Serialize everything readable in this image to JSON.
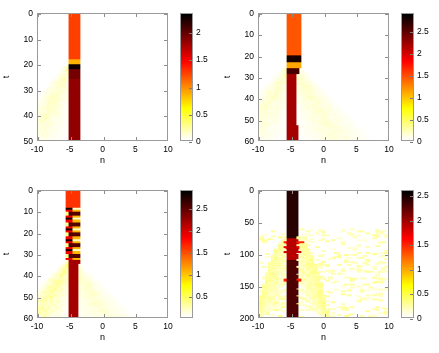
{
  "figure": {
    "kind": "four-panel-heatmap-figure",
    "colormap": "hot",
    "background": "#ffffff",
    "axis_color": "#9a9a9a"
  },
  "chart_data": [
    {
      "id": "panel-top-left",
      "type": "heatmap",
      "title": "",
      "xlabel": "n",
      "ylabel": "t",
      "xlim": [
        -10,
        10
      ],
      "ylim": [
        0,
        50
      ],
      "y_inverted": true,
      "xticks": [
        -10,
        -5,
        0,
        5,
        10
      ],
      "xticklabels": [
        "-10",
        "-5",
        "0",
        "5",
        "10"
      ],
      "yticks": [
        0,
        10,
        20,
        30,
        40,
        50
      ],
      "yticklabels": [
        "0",
        "10",
        "20",
        "30",
        "40",
        "50"
      ],
      "colormap": "hot",
      "clim": [
        0,
        2.35
      ],
      "colorbar": {
        "ticks": [
          0,
          0.5,
          1,
          1.5,
          2
        ],
        "ticklabels": [
          "0",
          "0.5",
          "1",
          "1.5",
          "2"
        ]
      },
      "features": {
        "central_column": {
          "n_range": [
            0,
            1.5
          ],
          "description": "persistent bright vertical stripe at the origin site"
        },
        "segments": [
          {
            "t_range": [
              0,
              18
            ],
            "n_range": [
              0,
              1.5
            ],
            "value": 1.25,
            "color": "#f44c00"
          },
          {
            "t_range": [
              18,
              20
            ],
            "n_range": [
              0,
              1.5
            ],
            "value": 0.85,
            "color": "#ffbf55"
          },
          {
            "t_range": [
              20,
              22
            ],
            "n_range": [
              0,
              1.5
            ],
            "value": 2.3,
            "color": "#2a1005"
          },
          {
            "t_range": [
              22,
              26
            ],
            "n_range": [
              0,
              1.5
            ],
            "value": 1.95,
            "color": "#5e2408"
          },
          {
            "t_range": [
              26,
              50
            ],
            "n_range": [
              0,
              1.5
            ],
            "value": 1.85,
            "color": "#6b2c0c"
          }
        ],
        "radiation": [
          {
            "direction": "down-left",
            "origin_t": 20,
            "value": 0.18,
            "description": "faint yellow fan emitted leftwards after the collapse"
          }
        ]
      }
    },
    {
      "id": "panel-top-right",
      "type": "heatmap",
      "title": "",
      "xlabel": "n",
      "ylabel": "t",
      "xlim": [
        -10,
        10
      ],
      "ylim": [
        0,
        60
      ],
      "y_inverted": true,
      "xticks": [
        -10,
        -5,
        0,
        5,
        10
      ],
      "xticklabels": [
        "-10",
        "-5",
        "0",
        "5",
        "10"
      ],
      "yticks": [
        0,
        10,
        20,
        30,
        40,
        50,
        60
      ],
      "yticklabels": [
        "0",
        "10",
        "20",
        "30",
        "40",
        "50",
        "60"
      ],
      "colormap": "hot",
      "clim": [
        0,
        2.9
      ],
      "colorbar": {
        "ticks": [
          0,
          0.5,
          1,
          1.5,
          2,
          2.5
        ],
        "ticklabels": [
          "0",
          "0.5",
          "1",
          "1.5",
          "2",
          "2.5"
        ]
      },
      "features": {
        "central_column": {
          "n_range": [
            -1.2,
            1.6
          ],
          "description": "twin orange columns flanking a pale core, merging into a dark stripe"
        },
        "segments": [
          {
            "t_range": [
              0,
              20
            ],
            "n_range": [
              -1.2,
              -0.3
            ],
            "value": 1.45,
            "color": "#f4621a"
          },
          {
            "t_range": [
              0,
              20
            ],
            "n_range": [
              -0.3,
              0.6
            ],
            "value": 0.95,
            "color": "#ffc97a"
          },
          {
            "t_range": [
              0,
              20
            ],
            "n_range": [
              0.6,
              1.6
            ],
            "value": 1.45,
            "color": "#f4621a"
          },
          {
            "t_range": [
              20,
              23
            ],
            "n_range": [
              -1.2,
              1.6
            ],
            "value": 2.8,
            "color": "#1e0c04"
          },
          {
            "t_range": [
              23,
              26
            ],
            "n_range": [
              -1.2,
              1.6
            ],
            "value": 1.1,
            "color": "#ffae48"
          },
          {
            "t_range": [
              26,
              29
            ],
            "n_range": [
              -1.2,
              1.6
            ],
            "value": 2.6,
            "color": "#331506"
          },
          {
            "t_range": [
              29,
              60
            ],
            "n_range": [
              -0.6,
              1.2
            ],
            "value": 2.2,
            "color": "#5c2409"
          }
        ],
        "radiation": [
          {
            "direction": "down-left",
            "origin_t": 24,
            "value": 0.2
          },
          {
            "direction": "down-right",
            "origin_t": 24,
            "value": 0.2
          }
        ]
      }
    },
    {
      "id": "panel-bottom-left",
      "type": "heatmap",
      "title": "",
      "xlabel": "n",
      "ylabel": "t",
      "xlim": [
        -10,
        10
      ],
      "ylim": [
        0,
        60
      ],
      "y_inverted": true,
      "xticks": [
        -10,
        -5,
        0,
        5,
        10
      ],
      "xticklabels": [
        "-10",
        "-5",
        "0",
        "5",
        "10"
      ],
      "yticks": [
        0,
        10,
        20,
        30,
        40,
        50,
        60
      ],
      "yticklabels": [
        "0",
        "10",
        "20",
        "30",
        "40",
        "50",
        "60"
      ],
      "colormap": "hot",
      "clim": [
        0,
        2.9
      ],
      "colorbar": {
        "ticks": [
          0.5,
          1,
          1.5,
          2,
          2.5
        ],
        "ticklabels": [
          "0.5",
          "1",
          "1.5",
          "2",
          "2.5"
        ]
      },
      "features": {
        "central_column": {
          "n_range": [
            -1.5,
            2
          ],
          "description": "oscillating checkerboard of bright red and dark cells above t=33, then a steady dark stripe"
        },
        "oscillation": {
          "t_range": [
            8,
            33
          ],
          "period": 5,
          "description": "alternating high/low amplitude beating between the two central sites"
        },
        "segments": [
          {
            "t_range": [
              0,
              8
            ],
            "n_range": [
              -1.5,
              2
            ],
            "value": 1.6,
            "color": "#f05a10"
          },
          {
            "t_range": [
              33,
              60
            ],
            "n_range": [
              0.2,
              2
            ],
            "value": 2.2,
            "color": "#5c2409"
          }
        ],
        "radiation": [
          {
            "direction": "down-left",
            "origin_t": 33,
            "value": 0.35,
            "description": "pronounced speckled yellow fan reaching n=-10"
          },
          {
            "direction": "down-right",
            "origin_t": 33,
            "value": 0.2
          }
        ]
      }
    },
    {
      "id": "panel-bottom-right",
      "type": "heatmap",
      "title": "",
      "xlabel": "n",
      "ylabel": "t",
      "xlim": [
        -10,
        10
      ],
      "ylim": [
        0,
        200
      ],
      "y_inverted": true,
      "xticks": [
        -10,
        -5,
        0,
        5,
        10
      ],
      "xticklabels": [
        "-10",
        "-5",
        "0",
        "5",
        "10"
      ],
      "yticks": [
        0,
        50,
        100,
        150,
        200
      ],
      "yticklabels": [
        "0",
        "50",
        "100",
        "150",
        "200"
      ],
      "colormap": "hot",
      "clim": [
        0,
        2.6
      ],
      "colorbar": {
        "ticks": [
          0,
          0.5,
          1,
          1.5,
          2,
          2.5
        ],
        "ticklabels": [
          "0",
          "0.5",
          "1",
          "1.5",
          "2",
          "2.5"
        ]
      },
      "features": {
        "central_column": {
          "n_range": [
            -1.3,
            1.3
          ],
          "description": "broad dark column persisting for the whole run, narrowing below t=110"
        },
        "segments": [
          {
            "t_range": [
              0,
              75
            ],
            "n_range": [
              -1.3,
              1.3
            ],
            "value": 2.45,
            "color": "#3a1606"
          },
          {
            "t_range": [
              75,
              110
            ],
            "n_range": [
              -1.3,
              1.3
            ],
            "value": 1.9,
            "color": "#c03a05"
          },
          {
            "t_range": [
              110,
              200
            ],
            "n_range": [
              -0.7,
              0.7
            ],
            "value": 2.3,
            "color": "#4a1c07"
          }
        ],
        "bursts": [
          {
            "t": 80,
            "n_range": [
              -2.5,
              2.5
            ],
            "value": 1.5
          },
          {
            "t": 88,
            "n_range": [
              -2.2,
              2.2
            ],
            "value": 1.7
          },
          {
            "t": 96,
            "n_range": [
              -2.5,
              1.5
            ],
            "value": 1.8
          },
          {
            "t": 140,
            "n_range": [
              -2.5,
              1.5
            ],
            "value": 1.5
          }
        ],
        "radiation": [
          {
            "shape": "arcs",
            "description": "family of faint curved arcs fanning out to both sides between t=70 and t=200"
          }
        ]
      }
    }
  ],
  "axis_labels": {
    "x": "n",
    "y": "t"
  }
}
